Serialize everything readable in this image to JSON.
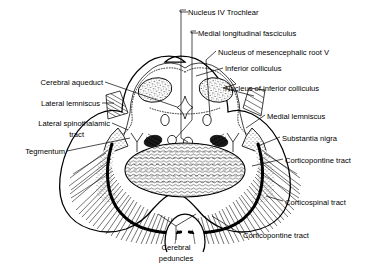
{
  "figure": {
    "style": "line-drawing",
    "ink_color": "#000000",
    "background_color": "#ffffff"
  },
  "labels": {
    "top": [
      {
        "id": "nucleus-iv-trochlear",
        "text": "Nucleus IV  Trochlear",
        "x": 188,
        "y": 12,
        "align": "left"
      },
      {
        "id": "medial-longitudinal-fasciculus",
        "text": "Medial longitudinal fasciculus",
        "x": 198,
        "y": 33,
        "align": "left"
      },
      {
        "id": "nucleus-mesencephalic-root-v",
        "text": "Nucleus of mesencephalic root V",
        "x": 218,
        "y": 53,
        "align": "left"
      },
      {
        "id": "inferior-colliculus",
        "text": "Inferior colliculus",
        "x": 225,
        "y": 69,
        "align": "left"
      },
      {
        "id": "nucleus-of-inferior-colliculus",
        "text": "Nucleus of inferior colliculus",
        "x": 225,
        "y": 89,
        "align": "left"
      }
    ],
    "left": [
      {
        "id": "cerebral-aqueduct",
        "text": "Cerebral aqueduct",
        "x": 103,
        "y": 84,
        "align": "right"
      },
      {
        "id": "lateral-lemniscus",
        "text": "Lateral lemniscus",
        "x": 100,
        "y": 105,
        "align": "right"
      },
      {
        "id": "lateral-spinothalamic-tract-line1",
        "text": "Lateral  spinothalamic",
        "x": 110,
        "y": 125,
        "align": "right"
      },
      {
        "id": "lateral-spinothalamic-tract-line2",
        "text": "tract",
        "x": 84,
        "y": 136,
        "align": "right"
      },
      {
        "id": "tegmentum",
        "text": "Tegmentum",
        "x": 65,
        "y": 153,
        "align": "right"
      }
    ],
    "right": [
      {
        "id": "medial-lemniscus",
        "text": "Medial lemniscus",
        "x": 267,
        "y": 117,
        "align": "left"
      },
      {
        "id": "substantia-nigra",
        "text": "Substantia nigra",
        "x": 282,
        "y": 139,
        "align": "left"
      },
      {
        "id": "corticopontine-tract-upper",
        "text": "Corticopontine tract",
        "x": 285,
        "y": 161,
        "align": "left"
      },
      {
        "id": "corticospinal-tract",
        "text": "Corticospinal  tract",
        "x": 285,
        "y": 203,
        "align": "left"
      },
      {
        "id": "corticopontine-tract-lower",
        "text": "Corticopontine tract",
        "x": 243,
        "y": 236,
        "align": "left"
      }
    ],
    "bottom": [
      {
        "id": "cerebral-peduncles-line1",
        "text": "Cerebral",
        "x": 176,
        "y": 248,
        "align": "center"
      },
      {
        "id": "cerebral-peduncles-line2",
        "text": "peduncles",
        "x": 176,
        "y": 259,
        "align": "center"
      }
    ]
  },
  "structures": [
    {
      "id": "inferior-colliculus-left",
      "kind": "stippled-oval"
    },
    {
      "id": "inferior-colliculus-right",
      "kind": "stippled-oval"
    },
    {
      "id": "cerebral-aqueduct",
      "kind": "star"
    },
    {
      "id": "medial-longitudinal-fasciculus-left",
      "kind": "small-oval"
    },
    {
      "id": "medial-longitudinal-fasciculus-right",
      "kind": "small-oval"
    },
    {
      "id": "nucleus-iv-trochlear",
      "kind": "small-oval"
    },
    {
      "id": "medial-lemniscus-left",
      "kind": "dark-oval"
    },
    {
      "id": "medial-lemniscus-right",
      "kind": "dark-oval"
    },
    {
      "id": "lateral-lemniscus-left",
      "kind": "hatched-wedge"
    },
    {
      "id": "nucleus-of-inferior-colliculus-right",
      "kind": "hatched-wedge"
    },
    {
      "id": "substantia-nigra-left",
      "kind": "dark-band"
    },
    {
      "id": "substantia-nigra-right",
      "kind": "dark-band"
    },
    {
      "id": "cerebral-peduncle-left",
      "kind": "hatched-mass"
    },
    {
      "id": "cerebral-peduncle-right",
      "kind": "hatched-mass"
    },
    {
      "id": "tegmentum-central",
      "kind": "hatched-core"
    }
  ]
}
